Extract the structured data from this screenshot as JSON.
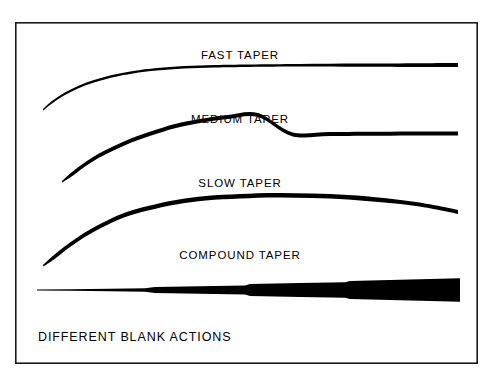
{
  "figure": {
    "caption": "DIFFERENT BLANK ACTIONS",
    "border_color": "#1a1a1a",
    "background_color": "#ffffff",
    "ink_color": "#000000",
    "labels": {
      "fast": "FAST TAPER",
      "medium": "MEDIUM TAPER",
      "slow": "SLOW TAPER",
      "compound": "COMPOUND TAPER"
    }
  },
  "chart_data": {
    "type": "line",
    "title": "DIFFERENT BLANK ACTIONS",
    "xlabel": "",
    "ylabel": "",
    "grid": false,
    "legend": "none",
    "annotations": [
      "FAST TAPER",
      "MEDIUM TAPER",
      "SLOW TAPER",
      "COMPOUND TAPER",
      "DIFFERENT BLANK ACTIONS"
    ],
    "series": [
      {
        "name": "FAST TAPER",
        "label_x": 240,
        "label_y": 59,
        "description": "Rod blank bending profile: sharp bend concentrated near the tip, butt section nearly straight.",
        "top_edge": [
          [
            43,
            109
          ],
          [
            52,
            101
          ],
          [
            64,
            93
          ],
          [
            78,
            86
          ],
          [
            94,
            80
          ],
          [
            112,
            75
          ],
          [
            133,
            71
          ],
          [
            157,
            68
          ],
          [
            184,
            66
          ],
          [
            215,
            65
          ],
          [
            250,
            64.5
          ],
          [
            300,
            64
          ],
          [
            360,
            63.6
          ],
          [
            420,
            63.2
          ],
          [
            458,
            63
          ]
        ],
        "bottom_edge": [
          [
            458,
            67
          ],
          [
            420,
            67
          ],
          [
            360,
            66.8
          ],
          [
            300,
            66.6
          ],
          [
            250,
            67
          ],
          [
            215,
            67.5
          ],
          [
            184,
            68.6
          ],
          [
            157,
            70.6
          ],
          [
            133,
            73.4
          ],
          [
            112,
            77.4
          ],
          [
            94,
            82.4
          ],
          [
            78,
            88.4
          ],
          [
            64,
            95.4
          ],
          [
            52,
            103.4
          ],
          [
            43,
            110.6
          ]
        ]
      },
      {
        "name": "MEDIUM TAPER",
        "label_x": 240,
        "label_y": 123,
        "description": "Rod blank bending profile: bend distributed through the upper half of the blank.",
        "top_edge": [
          [
            62,
            181
          ],
          [
            72,
            172
          ],
          [
            84,
            163
          ],
          [
            98,
            154
          ],
          [
            114,
            146
          ],
          [
            132,
            138
          ],
          [
            152,
            131
          ],
          [
            175,
            124
          ],
          [
            200,
            119
          ],
          [
            228,
            115
          ],
          [
            258,
            113
          ],
          [
            292,
            132.2
          ],
          [
            330,
            132
          ],
          [
            380,
            131.8
          ],
          [
            420,
            131.6
          ],
          [
            458,
            131.5
          ]
        ],
        "bottom_edge": [
          [
            458,
            135.5
          ],
          [
            420,
            135.6
          ],
          [
            380,
            135.8
          ],
          [
            330,
            136
          ],
          [
            292,
            136.2
          ],
          [
            258,
            117
          ],
          [
            228,
            119
          ],
          [
            200,
            123
          ],
          [
            175,
            128.2
          ],
          [
            152,
            135.2
          ],
          [
            132,
            142.2
          ],
          [
            114,
            150.2
          ],
          [
            98,
            158.2
          ],
          [
            84,
            167.2
          ],
          [
            72,
            176.2
          ],
          [
            62,
            182.6
          ]
        ]
      },
      {
        "name": "SLOW TAPER",
        "label_x": 240,
        "label_y": 187,
        "description": "Rod blank bending profile: full parabolic bend running right down into the butt; tip drops at the far end.",
        "top_edge": [
          [
            43,
            265
          ],
          [
            54,
            255
          ],
          [
            68,
            244
          ],
          [
            84,
            233
          ],
          [
            102,
            223
          ],
          [
            124,
            213
          ],
          [
            148,
            206
          ],
          [
            176,
            200
          ],
          [
            206,
            196
          ],
          [
            240,
            194
          ],
          [
            276,
            193
          ],
          [
            312,
            193.5
          ],
          [
            348,
            195
          ],
          [
            384,
            198
          ],
          [
            416,
            202
          ],
          [
            444,
            207
          ],
          [
            458,
            210
          ]
        ],
        "bottom_edge": [
          [
            458,
            214
          ],
          [
            444,
            211
          ],
          [
            416,
            206
          ],
          [
            384,
            202.5
          ],
          [
            348,
            199.5
          ],
          [
            312,
            198
          ],
          [
            276,
            197.5
          ],
          [
            240,
            198.5
          ],
          [
            206,
            200.5
          ],
          [
            176,
            204.5
          ],
          [
            148,
            210.5
          ],
          [
            124,
            217.5
          ],
          [
            102,
            227.5
          ],
          [
            84,
            237.5
          ],
          [
            68,
            248.5
          ],
          [
            54,
            259.5
          ],
          [
            43,
            266.6
          ]
        ]
      },
      {
        "name": "COMPOUND TAPER",
        "label_x": 240,
        "label_y": 259,
        "description": "Side profile of a multi-stage (stepped) blank taper, drawn straight; thickness increases in discrete steps from tip at left to butt at right.",
        "stations": [
          [
            37,
            0.9
          ],
          [
            70,
            1.6
          ],
          [
            110,
            2.6
          ],
          [
            145,
            3.5
          ],
          [
            155,
            6.0
          ],
          [
            200,
            7.6
          ],
          [
            245,
            9.2
          ],
          [
            250,
            11.8
          ],
          [
            300,
            13.8
          ],
          [
            345,
            15.6
          ],
          [
            350,
            18.2
          ],
          [
            400,
            20.6
          ],
          [
            460,
            23.5
          ]
        ],
        "centerline_y": 290,
        "core_gap": 4.0
      }
    ]
  }
}
